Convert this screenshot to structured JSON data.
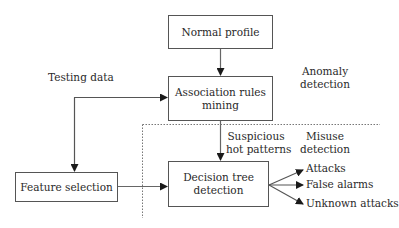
{
  "diagram": {
    "nodes": {
      "normal_profile": "Normal profile",
      "association_rules_line1": "Association rules",
      "association_rules_line2": "mining",
      "feature_selection": "Feature selection",
      "decision_tree_line1": "Decision tree",
      "decision_tree_line2": "detection"
    },
    "labels": {
      "testing_data": "Testing data",
      "anomaly_line1": "Anomaly",
      "anomaly_line2": "detection",
      "suspicious_line1": "Suspicious",
      "suspicious_line2": "hot patterns",
      "misuse_line1": "Misuse",
      "misuse_line2": "detection"
    },
    "outputs": [
      "Attacks",
      "False alarms",
      "Unknown attacks"
    ],
    "edges": [
      {
        "from": "Normal profile",
        "to": "Association rules mining"
      },
      {
        "from": "Association rules mining",
        "to": "Decision tree detection",
        "label": "Suspicious hot patterns"
      },
      {
        "from": "Association rules mining",
        "to": "Feature selection",
        "bidirectional": true,
        "label": "Testing data"
      },
      {
        "from": "Feature selection",
        "to": "Decision tree detection"
      },
      {
        "from": "Decision tree detection",
        "to": "Attacks"
      },
      {
        "from": "Decision tree detection",
        "to": "False alarms"
      },
      {
        "from": "Decision tree detection",
        "to": "Unknown attacks"
      }
    ],
    "regions": [
      "Anomaly detection",
      "Misuse detection"
    ]
  }
}
